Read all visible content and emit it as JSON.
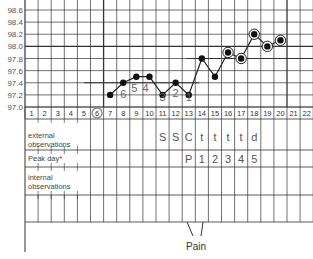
{
  "chart_data": {
    "type": "line",
    "title": "",
    "xlabel": "Cycle day",
    "ylabel": "Temperature",
    "ylim": [
      97.0,
      98.6
    ],
    "yticks": [
      "98.6",
      "98.4",
      "98.2",
      "98.0",
      "97.8",
      "97.6",
      "97.4",
      "97.2",
      "97.0"
    ],
    "days": [
      "1",
      "2",
      "3",
      "4",
      "5",
      "6",
      "7",
      "8",
      "9",
      "10",
      "11",
      "12",
      "13",
      "14",
      "15",
      "16",
      "17",
      "18",
      "19",
      "20",
      "21",
      "22"
    ],
    "circled_day": "6",
    "series": [
      {
        "name": "BBT",
        "x": [
          7,
          8,
          9,
          10,
          11,
          12,
          13,
          14,
          15,
          16,
          17,
          18,
          19,
          20
        ],
        "values": [
          97.2,
          97.4,
          97.5,
          97.5,
          97.2,
          97.4,
          97.2,
          97.8,
          97.5,
          97.9,
          97.8,
          98.2,
          98.0,
          98.1
        ]
      }
    ],
    "circled_points_days": [
      16,
      17,
      18,
      19,
      20
    ],
    "low_temp_labels": [
      {
        "day": 8,
        "text": "6"
      },
      {
        "day": 9,
        "text": "5"
      },
      {
        "day": 10,
        "text": "4"
      },
      {
        "day": 11,
        "text": "3"
      },
      {
        "day": 12,
        "text": "2"
      },
      {
        "day": 13,
        "text": "1"
      }
    ],
    "coverline_low": 97.4,
    "coverline_high": 97.8,
    "rows": {
      "external_observations": {
        "label": "external observations",
        "values": {
          "11": "S",
          "12": "S",
          "13": "C",
          "14": "t",
          "15": "t",
          "16": "t",
          "17": "t",
          "18": "d"
        }
      },
      "peak_day": {
        "label": "Peak day*",
        "values": {
          "13": "P",
          "14": "1",
          "15": "2",
          "16": "3",
          "17": "4",
          "18": "5"
        }
      },
      "internal_observations": {
        "label": "internal observations",
        "values": {}
      }
    },
    "annotation": {
      "text": "Pain",
      "day": 13
    }
  }
}
